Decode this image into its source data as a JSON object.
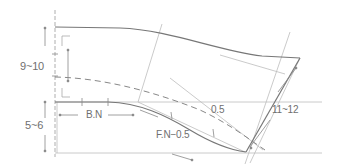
{
  "diagram": {
    "title": "",
    "labels": {
      "upper_height": "9~10",
      "lower_height": "5~6",
      "back_neck": "B.N",
      "front_neck": "F.N−0.5",
      "offset": "0.5",
      "side_length": "11~12"
    },
    "colors": {
      "main_line": "#7a7a7a",
      "guide_line": "#b5b5b5",
      "dashed_line": "#8a8a8a",
      "text": "#6f6f6f"
    }
  }
}
